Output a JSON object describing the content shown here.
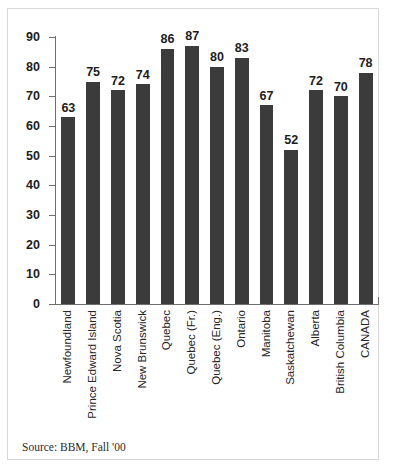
{
  "chart_data": {
    "type": "bar",
    "title": "",
    "subtitle": "",
    "xlabel": "",
    "ylabel": "",
    "ylim": [
      0,
      90
    ],
    "ytick_step": 10,
    "yticks": [
      90,
      80,
      70,
      60,
      50,
      40,
      30,
      20,
      10,
      0
    ],
    "grid": false,
    "legend": false,
    "categories": [
      "Newfoundland",
      "Prince Edward Island",
      "Nova Scotia",
      "New Brunswick",
      "Quebec",
      "Quebec (Fr.)",
      "Quebec (Eng.)",
      "Ontario",
      "Manitoba",
      "Saskatchewan",
      "Alberta",
      "British Columbia",
      "CANADA"
    ],
    "values": [
      63,
      75,
      72,
      74,
      86,
      87,
      80,
      83,
      67,
      52,
      72,
      70,
      78
    ],
    "data_labels": [
      "63",
      "75",
      "72",
      "74",
      "86",
      "87",
      "80",
      "83",
      "67",
      "52",
      "72",
      "70",
      "78"
    ],
    "bar_color": "#3b3b3b",
    "axis_color": "#6e6e6e",
    "text_color": "#1d1d1d"
  },
  "source": {
    "text": "Source: BBM, Fall '00"
  }
}
